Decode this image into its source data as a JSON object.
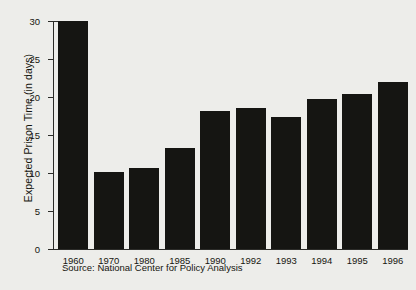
{
  "chart_data": {
    "type": "bar",
    "title": "",
    "xlabel": "",
    "ylabel": "Expected Prison Time (in days)",
    "categories": [
      "1960",
      "1970",
      "1980",
      "1985",
      "1990",
      "1992",
      "1993",
      "1994",
      "1995",
      "1996"
    ],
    "values": [
      30.0,
      10.1,
      10.7,
      13.3,
      18.1,
      18.6,
      17.4,
      19.7,
      20.4,
      22.0
    ],
    "ylim": [
      0,
      30
    ],
    "yticks": [
      0,
      5,
      10,
      15,
      20,
      25,
      30
    ],
    "ytick_labels": [
      "0",
      "5",
      "10",
      "15",
      "20",
      "25",
      "30"
    ],
    "grid": false,
    "legend": null,
    "bar_color": "#151512",
    "axis_color": "#2b2b28",
    "background_color": "#ededea",
    "source_note": "Source: National Center for Policy Analysis"
  }
}
